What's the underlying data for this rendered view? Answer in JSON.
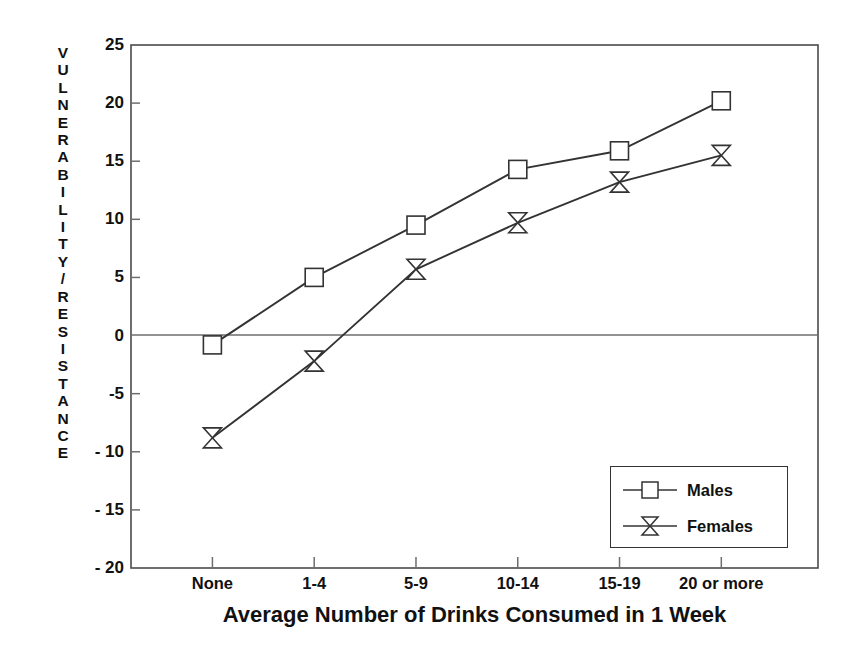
{
  "chart_data": {
    "type": "line",
    "title": "",
    "subtitle": "",
    "xlabel": "Average Number of Drinks Consumed in 1 Week",
    "ylabel": "VULNERABILITY/RESISTANCE",
    "categories": [
      "None",
      "1-4",
      "5-9",
      "10-14",
      "15-19",
      "20 or more"
    ],
    "series": [
      {
        "name": "Males",
        "marker": "square",
        "color": "#333333",
        "values": [
          -0.8,
          5.0,
          9.5,
          14.3,
          15.9,
          20.2
        ]
      },
      {
        "name": "Females",
        "marker": "bowtie",
        "color": "#333333",
        "values": [
          -8.8,
          -2.2,
          5.7,
          9.7,
          13.2,
          15.5
        ]
      }
    ],
    "ylim": [
      -20,
      25
    ],
    "yticks": [
      25,
      20,
      15,
      10,
      5,
      0,
      "-5",
      "- 10",
      "- 15",
      "- 20"
    ],
    "ytick_values": [
      25,
      20,
      15,
      10,
      5,
      0,
      -5,
      -10,
      -15,
      -20
    ],
    "grid": false,
    "zero_line": true,
    "legend_position": "lower-right",
    "frame": true
  },
  "axis": {
    "ylabel_letters": [
      "V",
      "U",
      "L",
      "N",
      "E",
      "R",
      "A",
      "B",
      "I",
      "L",
      "I",
      "T",
      "Y",
      "/",
      "R",
      "E",
      "S",
      "I",
      "S",
      "T",
      "A",
      "N",
      "C",
      "E"
    ]
  },
  "legend": {
    "entries": [
      "Males",
      "Females"
    ]
  }
}
